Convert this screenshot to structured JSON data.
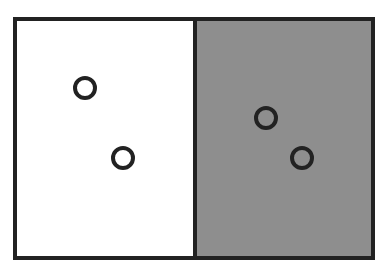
{
  "diagram": {
    "panels": [
      {
        "name": "left",
        "fill": "#ffffff",
        "circles": [
          {
            "x": 85,
            "y": 88
          },
          {
            "x": 123,
            "y": 158
          }
        ]
      },
      {
        "name": "right",
        "fill": "#8e8e8e",
        "circles": [
          {
            "x": 266,
            "y": 118
          },
          {
            "x": 302,
            "y": 158
          }
        ]
      }
    ]
  }
}
